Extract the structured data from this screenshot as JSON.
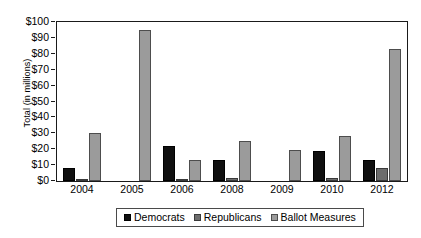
{
  "chart_data": {
    "type": "bar",
    "title": "",
    "subtitle": "",
    "xlabel": "",
    "ylabel": "Total (in millions)",
    "categories": [
      "2004",
      "2005",
      "2006",
      "2008",
      "2009",
      "2010",
      "2012"
    ],
    "series": [
      {
        "name": "Democrats",
        "color": "#101010",
        "values": [
          8.5,
          0,
          22,
          13.5,
          0,
          19,
          13.5
        ]
      },
      {
        "name": "Republicans",
        "color": "#6d6d6d",
        "values": [
          1,
          0,
          0.5,
          2,
          0,
          2,
          8
        ]
      },
      {
        "name": "Ballot Measures",
        "color": "#9b9b9b",
        "values": [
          30,
          95,
          13.5,
          25,
          19.5,
          28.5,
          83
        ]
      }
    ],
    "ylim": [
      0,
      100
    ],
    "ytick_step": 10,
    "ytick_labels": [
      "$0",
      "$10",
      "$20",
      "$30",
      "$40",
      "$50",
      "$60",
      "$70",
      "$80",
      "$90",
      "$100"
    ],
    "ytick_values": [
      0,
      10,
      20,
      30,
      40,
      50,
      60,
      70,
      80,
      90,
      100
    ],
    "grid": false,
    "legend_position": "bottom",
    "legend_entries": [
      "Democrats",
      "Republicans",
      "Ballot Measures"
    ],
    "axis_color": "#1a1a1a",
    "background_color": "#ffffff"
  }
}
